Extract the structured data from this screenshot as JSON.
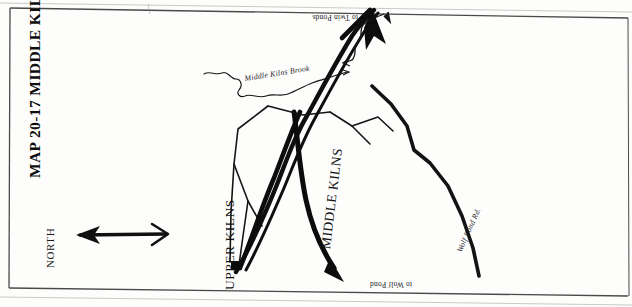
{
  "map": {
    "title": "MAP 20-17 MIDDLE KILNS",
    "orientation": {
      "compass_label": "NORTH",
      "arrow_direction": "left",
      "note": "north arrow points to image-left; map sheet is printed upside-down"
    },
    "labels": {
      "upper_kilns": "UPPER KILNS",
      "middle_kilns": "MIDDLE KILNS",
      "middle_kilns_brook": "Middle Kilns Brook",
      "wolf_pond_rd": "Wolf Pond Rd.",
      "to_twin_ponds": "to Twin Ponds",
      "to_wolf_pond": "to Wolf Pond"
    },
    "features": [
      {
        "name": "upper-kilns-site",
        "type": "site-marker",
        "label": "UPPER KILNS"
      },
      {
        "name": "middle-kilns-clearing",
        "type": "clearing",
        "label": "MIDDLE KILNS"
      },
      {
        "name": "middle-kilns-brook",
        "type": "stream",
        "label": "Middle Kilns Brook"
      },
      {
        "name": "wolf-pond-road",
        "type": "road",
        "label": "Wolf Pond Rd."
      },
      {
        "name": "twin-ponds-route",
        "type": "route-arrow",
        "label": "to Twin Ponds"
      },
      {
        "name": "wolf-pond-route",
        "type": "route-arrow",
        "label": "to Wolf Pond"
      }
    ],
    "colors": {
      "ink": "#111111",
      "paper": "#ffffff",
      "border": "#3a3a3a"
    }
  }
}
